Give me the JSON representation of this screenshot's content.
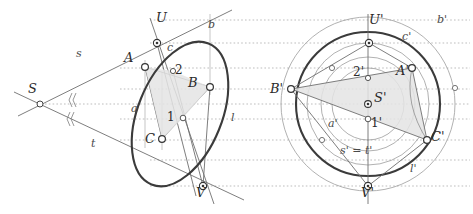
{
  "figure": {
    "width": 473,
    "height": 214,
    "background": "#ffffff",
    "colors": {
      "conic_stroke": "#3b3b3b",
      "thin_line": "#7a7a7a",
      "guide_dotted": "#9a9a9a",
      "aux_circle": "#9a9a9a",
      "shade_fill": "#e2e2e2",
      "marker_fill": "#ffffff",
      "marker_stroke": "#444444",
      "text": "#2b2b2b"
    }
  },
  "left_view": {
    "name": "oblique-view",
    "points": [
      {
        "id": "S",
        "label": "S",
        "x": 40,
        "y": 104,
        "label_x": 28,
        "label_y": 88,
        "marker": "open"
      },
      {
        "id": "U",
        "label": "U",
        "x": 157,
        "y": 43,
        "label_x": 158,
        "label_y": 18,
        "marker": "target"
      },
      {
        "id": "A",
        "label": "A",
        "x": 145,
        "y": 67,
        "label_x": 126,
        "label_y": 58,
        "marker": "open"
      },
      {
        "id": "B",
        "label": "B",
        "x": 210,
        "y": 87,
        "label_x": 189,
        "label_y": 82,
        "marker": "open"
      },
      {
        "id": "C",
        "label": "C",
        "x": 162,
        "y": 139,
        "label_x": 147,
        "label_y": 138,
        "marker": "open"
      },
      {
        "id": "V",
        "label": "V",
        "x": 203,
        "y": 186,
        "label_x": 198,
        "label_y": 190,
        "marker": "target"
      },
      {
        "id": "P2",
        "label": "2",
        "x": 173,
        "y": 71,
        "label_x": 174,
        "label_y": 66,
        "marker": "open"
      },
      {
        "id": "P1",
        "label": "1",
        "x": 183,
        "y": 118,
        "label_x": 167,
        "label_y": 113,
        "marker": "open"
      }
    ],
    "line_labels": [
      {
        "id": "s",
        "label": "s",
        "x": 78,
        "y": 54
      },
      {
        "id": "t",
        "label": "t",
        "x": 93,
        "y": 144
      },
      {
        "id": "b",
        "label": "b",
        "x": 209,
        "y": 24
      },
      {
        "id": "c",
        "label": "c",
        "x": 168,
        "y": 48
      },
      {
        "id": "a",
        "label": "a",
        "x": 133,
        "y": 109
      },
      {
        "id": "l",
        "label": "l",
        "x": 232,
        "y": 118
      }
    ]
  },
  "right_view": {
    "name": "circle-view",
    "points": [
      {
        "id": "Sp",
        "label": "S'",
        "x": 368,
        "y": 104,
        "label_x": 374,
        "label_y": 98,
        "marker": "target"
      },
      {
        "id": "Up",
        "label": "U'",
        "x": 369,
        "y": 43,
        "label_x": 371,
        "label_y": 20,
        "marker": "target"
      },
      {
        "id": "Ap",
        "label": "A'",
        "x": 412,
        "y": 68,
        "label_x": 399,
        "label_y": 72,
        "marker": "open"
      },
      {
        "id": "Bp",
        "label": "B'",
        "x": 291,
        "y": 89,
        "label_x": 273,
        "label_y": 88,
        "marker": "open"
      },
      {
        "id": "Cp",
        "label": "C'",
        "x": 427,
        "y": 140,
        "label_x": 431,
        "label_y": 136,
        "marker": "open"
      },
      {
        "id": "Vp",
        "label": "V'",
        "x": 368,
        "y": 186,
        "label_x": 363,
        "label_y": 190,
        "marker": "target"
      },
      {
        "id": "P2p",
        "label": "2'",
        "x": 368,
        "y": 78,
        "label_x": 355,
        "label_y": 72,
        "marker": "open"
      },
      {
        "id": "P1p",
        "label": "1'",
        "x": 368,
        "y": 119,
        "label_x": 372,
        "label_y": 122,
        "marker": "open"
      },
      {
        "id": "mA",
        "label": "",
        "x": 332,
        "y": 68,
        "label_x": 0,
        "label_y": 0,
        "marker": "open"
      },
      {
        "id": "mB",
        "label": "",
        "x": 322,
        "y": 140,
        "label_x": 0,
        "label_y": 0,
        "marker": "open"
      },
      {
        "id": "mC",
        "label": "",
        "x": 455,
        "y": 88,
        "label_x": 0,
        "label_y": 0,
        "marker": "open"
      }
    ],
    "line_labels": [
      {
        "id": "bp",
        "label": "b'",
        "x": 439,
        "y": 20
      },
      {
        "id": "cp",
        "label": "c'",
        "x": 404,
        "y": 38
      },
      {
        "id": "ap",
        "label": "a'",
        "x": 330,
        "y": 125
      },
      {
        "id": "lp",
        "label": "l'",
        "x": 412,
        "y": 170
      },
      {
        "id": "stp",
        "label": "s' = t'",
        "x": 343,
        "y": 151
      }
    ]
  },
  "guides": {
    "horizontal_y": [
      20,
      43,
      68,
      89,
      104,
      119,
      140,
      160,
      186
    ],
    "x_start": 8,
    "x_end": 470
  }
}
